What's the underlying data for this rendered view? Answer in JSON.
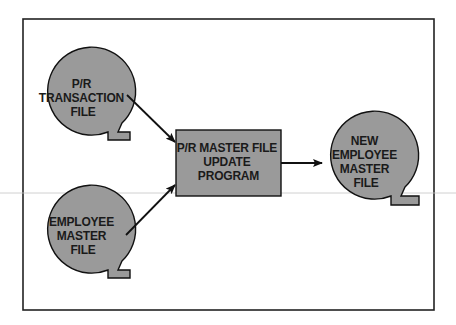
{
  "diagram": {
    "type": "flowchart",
    "colors": {
      "shape_fill": "#9a9a9a",
      "stroke": "#111111",
      "background": "#ffffff",
      "frame": "#222222",
      "scanline": "#b8b8b8"
    },
    "nodes": [
      {
        "id": "pr-transaction-file",
        "shape": "magnetic-tape",
        "lines": [
          "P/R",
          "TRANSACTION",
          "FILE"
        ]
      },
      {
        "id": "employee-master-file",
        "shape": "magnetic-tape",
        "lines": [
          "EMPLOYEE",
          "MASTER",
          "FILE"
        ]
      },
      {
        "id": "pr-master-file-update-program",
        "shape": "process-box",
        "lines": [
          "P/R MASTER FILE",
          "UPDATE",
          "PROGRAM"
        ]
      },
      {
        "id": "new-employee-master-file",
        "shape": "magnetic-tape",
        "lines": [
          "NEW",
          "EMPLOYEE",
          "MASTER",
          "FILE"
        ]
      }
    ],
    "edges": [
      {
        "from": "pr-transaction-file",
        "to": "pr-master-file-update-program"
      },
      {
        "from": "employee-master-file",
        "to": "pr-master-file-update-program"
      },
      {
        "from": "pr-master-file-update-program",
        "to": "new-employee-master-file"
      }
    ]
  }
}
